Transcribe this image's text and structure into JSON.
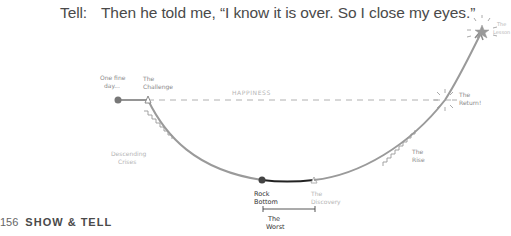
{
  "heading": {
    "label": "Tell:",
    "quote": "Then he told me, “I know it is over. So I close my eyes.”"
  },
  "diagram": {
    "baseline_label": "HAPPINESS",
    "points": {
      "start": {
        "label_line1": "One fine",
        "label_line2": "day..."
      },
      "challenge": {
        "label_line1": "The",
        "label_line2": "Challenge"
      },
      "descending": {
        "label_line1": "Descending",
        "label_line2": "Crises"
      },
      "rock_bottom": {
        "label_line1": "Rock",
        "label_line2": "Bottom"
      },
      "discovery": {
        "label_line1": "The",
        "label_line2": "Discovery"
      },
      "worst": {
        "label_line1": "The",
        "label_line2": "Worst"
      },
      "rise": {
        "label_line1": "The",
        "label_line2": "Rise"
      },
      "return": {
        "label_line1": "The",
        "label_line2": "Return!"
      },
      "lesson": {
        "label_line1": "The",
        "label_line2": "Lesson"
      }
    },
    "colors": {
      "curve": "#9a9a9a",
      "worst_segment": "#222222",
      "dashed": "#b0b0b0"
    }
  },
  "footer": {
    "page_number": "156",
    "book_title": "SHOW & TELL"
  }
}
